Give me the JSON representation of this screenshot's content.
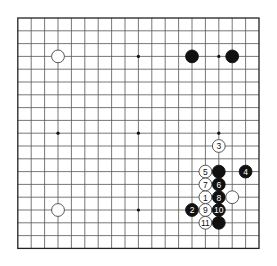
{
  "board": {
    "size": 19,
    "origin_x": 17.8,
    "origin_y": 18,
    "spacing_x": 13.4,
    "spacing_y": 12.8,
    "stone_radius": 6.4,
    "line_color": "#555555",
    "border_color": "#222222",
    "black_color": "#111111",
    "white_fill": "#ffffff",
    "white_stroke": "#444444",
    "star_points": [
      [
        3,
        3
      ],
      [
        9,
        3
      ],
      [
        15,
        3
      ],
      [
        3,
        9
      ],
      [
        9,
        9
      ],
      [
        15,
        9
      ],
      [
        3,
        15
      ],
      [
        9,
        15
      ],
      [
        15,
        15
      ]
    ]
  },
  "stones": [
    {
      "color": "white",
      "col": 3,
      "row": 3,
      "label": ""
    },
    {
      "color": "white",
      "col": 3,
      "row": 15,
      "label": ""
    },
    {
      "color": "black",
      "col": 13,
      "row": 3,
      "label": ""
    },
    {
      "color": "black",
      "col": 16,
      "row": 3,
      "label": ""
    },
    {
      "color": "white",
      "col": 14,
      "row": 14,
      "label": "1"
    },
    {
      "color": "black",
      "col": 13,
      "row": 15,
      "label": "2"
    },
    {
      "color": "white",
      "col": 15,
      "row": 10,
      "label": "3"
    },
    {
      "color": "black",
      "col": 17,
      "row": 12,
      "label": "4"
    },
    {
      "color": "white",
      "col": 14,
      "row": 12,
      "label": "5"
    },
    {
      "color": "black",
      "col": 15,
      "row": 13,
      "label": "6"
    },
    {
      "color": "white",
      "col": 14,
      "row": 13,
      "label": "7"
    },
    {
      "color": "black",
      "col": 15,
      "row": 14,
      "label": "8"
    },
    {
      "color": "white",
      "col": 14,
      "row": 15,
      "label": "9"
    },
    {
      "color": "black",
      "col": 15,
      "row": 15,
      "label": "10"
    },
    {
      "color": "white",
      "col": 14,
      "row": 16,
      "label": "11"
    },
    {
      "color": "black",
      "col": 15,
      "row": 12,
      "label": ""
    },
    {
      "color": "white",
      "col": 16,
      "row": 14,
      "label": ""
    },
    {
      "color": "black",
      "col": 15,
      "row": 16,
      "label": ""
    }
  ]
}
